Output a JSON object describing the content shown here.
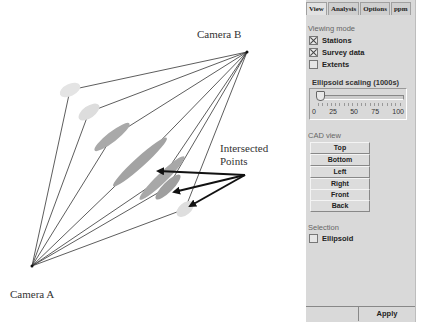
{
  "diagram": {
    "labels": {
      "camera_a": "Camera A",
      "camera_b": "Camera B",
      "intersected_line1": "Intersected",
      "intersected_line2": "Points"
    },
    "camera_a": [
      32,
      266
    ],
    "camera_b": [
      247,
      52
    ],
    "ellipses": [
      {
        "cx": 70,
        "cy": 90,
        "rx": 11,
        "ry": 6,
        "angle": -25,
        "fill": "#e4e4e4"
      },
      {
        "cx": 89,
        "cy": 112,
        "rx": 12,
        "ry": 6,
        "angle": -35,
        "fill": "#dddddd"
      },
      {
        "cx": 112,
        "cy": 137,
        "rx": 22,
        "ry": 5,
        "angle": -38,
        "fill": "#a9a9a9"
      },
      {
        "cx": 140,
        "cy": 162,
        "rx": 36,
        "ry": 5,
        "angle": -42,
        "fill": "#a3a3a3"
      },
      {
        "cx": 162,
        "cy": 178,
        "rx": 31,
        "ry": 5,
        "angle": -44,
        "fill": "#a8a8a8"
      },
      {
        "cx": 168,
        "cy": 187,
        "rx": 17,
        "ry": 5,
        "angle": -45,
        "fill": "#9f9f9f"
      },
      {
        "cx": 185,
        "cy": 209,
        "rx": 10,
        "ry": 6,
        "angle": -40,
        "fill": "#dedede"
      }
    ],
    "arrow_origin": [
      245,
      175
    ],
    "arrow_targets": [
      [
        158,
        171
      ],
      [
        174,
        192
      ],
      [
        190,
        206
      ]
    ]
  },
  "panel": {
    "tabs": [
      {
        "label": "View",
        "active": true
      },
      {
        "label": "Analysis",
        "active": false
      },
      {
        "label": "Options",
        "active": false
      },
      {
        "label": "ppm",
        "active": false
      }
    ],
    "viewing_mode": {
      "title": "Viewing mode",
      "items": [
        {
          "label": "Stations",
          "checked": true
        },
        {
          "label": "Survey data",
          "checked": true
        },
        {
          "label": "Extents",
          "checked": false
        }
      ]
    },
    "ellipsoid_scaling": {
      "title": "Ellipsoid scaling (1000s)",
      "value": 0,
      "ticks": [
        "0",
        "25",
        "50",
        "75",
        "100"
      ]
    },
    "cad_view": {
      "title": "CAD view",
      "buttons": [
        "Top",
        "Bottom",
        "Left",
        "Right",
        "Front",
        "Back"
      ]
    },
    "selection": {
      "title": "Selection",
      "items": [
        {
          "label": "Ellipsoid",
          "checked": false
        }
      ]
    },
    "apply_label": "Apply"
  }
}
